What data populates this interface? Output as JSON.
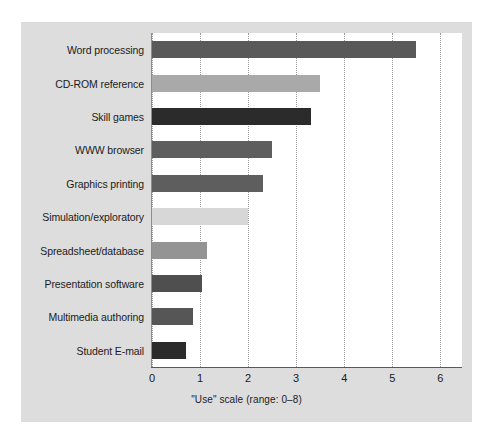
{
  "chart_data": {
    "type": "bar",
    "orientation": "horizontal",
    "title": "",
    "xlabel": "\"Use\" scale (range: 0–8)",
    "ylabel": "",
    "xlim": [
      0,
      6.45
    ],
    "ylim": null,
    "grid": "vertical-dotted",
    "legend": "none",
    "xticks": [
      "0",
      "1",
      "2",
      "3",
      "4",
      "5",
      "6"
    ],
    "xtick_values": [
      0,
      1,
      2,
      3,
      4,
      5,
      6
    ],
    "categories": [
      "Word processing",
      "CD-ROM reference",
      "Skill games",
      "WWW browser",
      "Graphics printing",
      "Simulation/exploratory",
      "Spreadsheet/database",
      "Presentation software",
      "Multimedia authoring",
      "Student E-mail"
    ],
    "values": [
      5.5,
      3.5,
      3.3,
      2.5,
      2.3,
      2.0,
      1.15,
      1.05,
      0.85,
      0.7
    ],
    "bar_colors": [
      "#595959",
      "#a9a9a9",
      "#2b2b2b",
      "#5e5e5e",
      "#5e5e5e",
      "#d7d7d7",
      "#949494",
      "#4f4f4f",
      "#565656",
      "#2b2b2b"
    ],
    "bars": [
      {
        "category": "Word processing",
        "value": 5.5,
        "color": "#595959"
      },
      {
        "category": "CD-ROM reference",
        "value": 3.5,
        "color": "#a9a9a9"
      },
      {
        "category": "Skill games",
        "value": 3.3,
        "color": "#2b2b2b"
      },
      {
        "category": "WWW browser",
        "value": 2.5,
        "color": "#5e5e5e"
      },
      {
        "category": "Graphics printing",
        "value": 2.3,
        "color": "#5e5e5e"
      },
      {
        "category": "Simulation/exploratory",
        "value": 2.0,
        "color": "#d7d7d7"
      },
      {
        "category": "Spreadsheet/database",
        "value": 1.15,
        "color": "#949494"
      },
      {
        "category": "Presentation software",
        "value": 1.05,
        "color": "#4f4f4f"
      },
      {
        "category": "Multimedia authoring",
        "value": 0.85,
        "color": "#565656"
      },
      {
        "category": "Student E-mail",
        "value": 0.7,
        "color": "#2b2b2b"
      }
    ]
  },
  "figure": {
    "panel_color": "#dddddd",
    "plot_background": "#ffffff",
    "page_background": "#ffffff",
    "gridline_color": "#9a9a9a",
    "axis_color": "#5a5a5a",
    "text_color": "#1b1b1b"
  }
}
